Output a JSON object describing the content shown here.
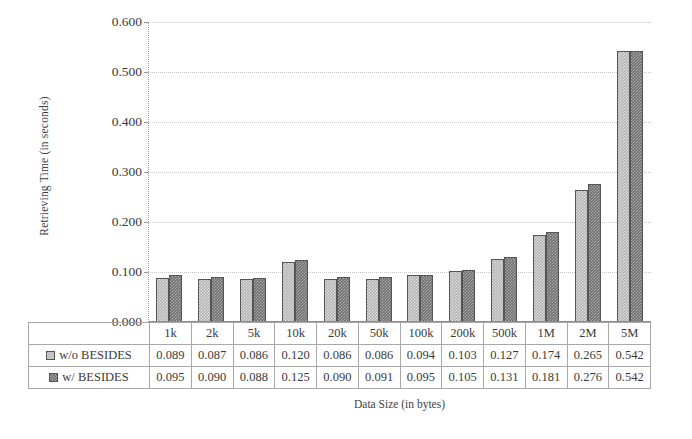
{
  "chart_data": {
    "type": "bar",
    "title": "",
    "xlabel": "Data Size (in bytes)",
    "ylabel": "Retrieving Time (in seconds)",
    "categories": [
      "1k",
      "2k",
      "5k",
      "10k",
      "20k",
      "50k",
      "100k",
      "200k",
      "500k",
      "1M",
      "2M",
      "5M"
    ],
    "series": [
      {
        "name": "w/o BESIDES",
        "color": "#b3b3b3",
        "values": [
          0.089,
          0.087,
          0.086,
          0.12,
          0.086,
          0.086,
          0.094,
          0.103,
          0.127,
          0.174,
          0.265,
          0.542
        ],
        "value_labels": [
          "0.089",
          "0.087",
          "0.086",
          "0.120",
          "0.086",
          "0.086",
          "0.094",
          "0.103",
          "0.127",
          "0.174",
          "0.265",
          "0.542"
        ]
      },
      {
        "name": "w/ BESIDES",
        "color": "#6e6e6e",
        "values": [
          0.095,
          0.09,
          0.088,
          0.125,
          0.09,
          0.091,
          0.095,
          0.105,
          0.131,
          0.181,
          0.276,
          0.542
        ],
        "value_labels": [
          "0.095",
          "0.090",
          "0.088",
          "0.125",
          "0.090",
          "0.091",
          "0.095",
          "0.105",
          "0.131",
          "0.181",
          "0.276",
          "0.542"
        ]
      }
    ],
    "ylim": [
      0.0,
      0.6
    ],
    "ytick_labels": [
      "0.000",
      "0.100",
      "0.200",
      "0.300",
      "0.400",
      "0.500",
      "0.600"
    ],
    "ytick_values": [
      0.0,
      0.1,
      0.2,
      0.3,
      0.4,
      0.5,
      0.6
    ],
    "grid": true,
    "legend_position": "data-table",
    "has_data_table": true
  }
}
